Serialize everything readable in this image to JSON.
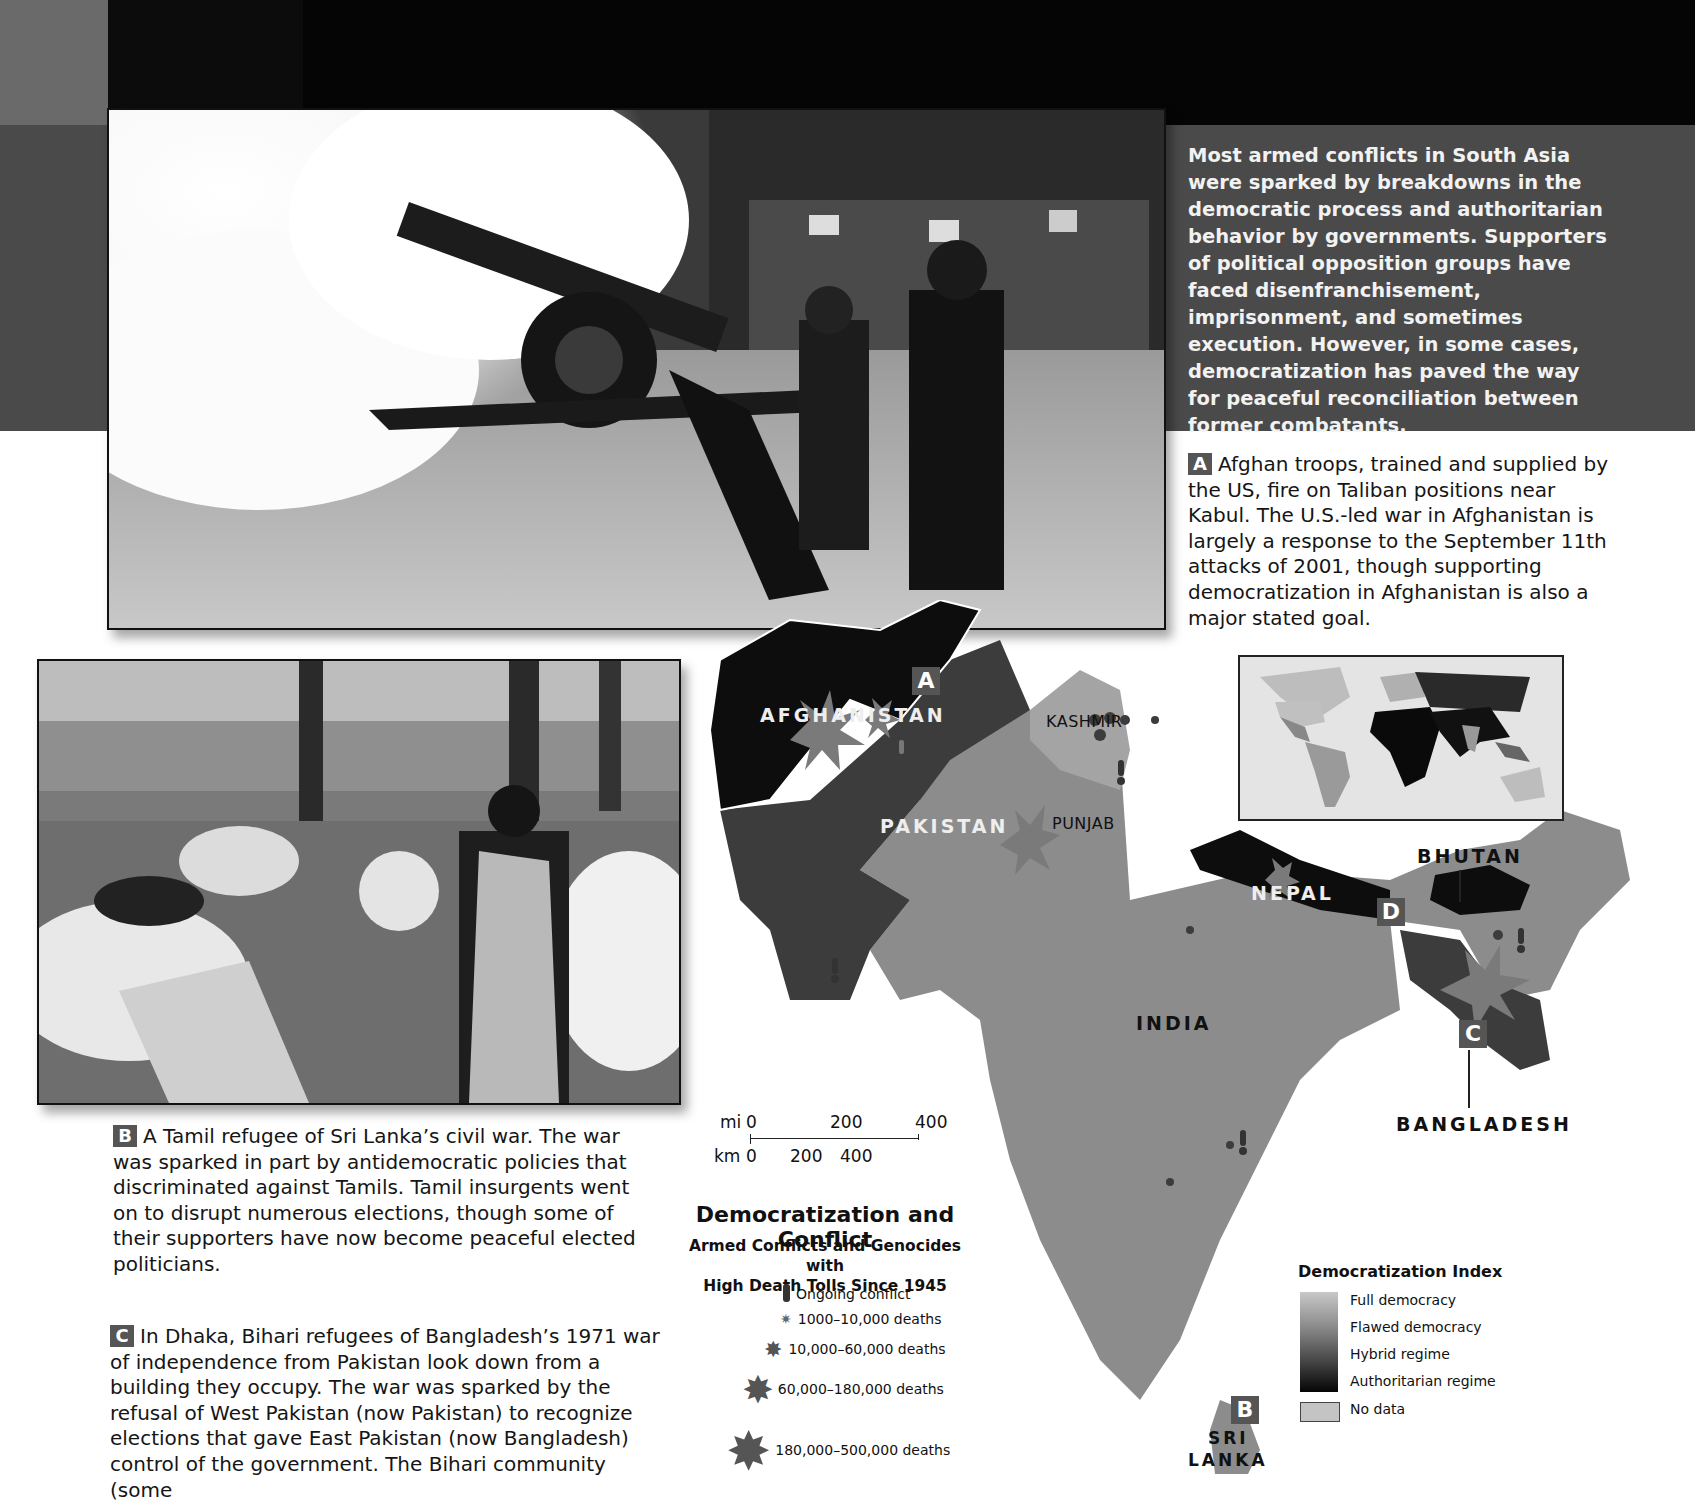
{
  "intro": {
    "text": "Most armed conflicts in South Asia were sparked by breakdowns in the democratic process and authoritarian behavior by governments. Supporters of political opposition groups have faced disenfranchisement, imprisonment, and sometimes execution. However, in some cases, democratization has paved the way for peaceful reconciliation between former combatants."
  },
  "captions": {
    "a": {
      "badge": "A",
      "text": "Afghan troops, trained and supplied by the US, fire on Taliban positions near Kabul. The U.S.-led war in Afghanistan is largely a response to the September 11th attacks of 2001, though supporting democratization in Afghanistan is also a major stated goal."
    },
    "b": {
      "badge": "B",
      "text": "A Tamil refugee of Sri Lanka’s civil war. The war was sparked in part by antidemocratic policies that discriminated against Tamils. Tamil insurgents went on to disrupt numerous elections, though some of their supporters have now become peaceful elected politicians."
    },
    "c": {
      "badge": "C",
      "text": "In Dhaka, Bihari refugees of Bangladesh’s 1971 war of independence from Pakistan look down from a building they occupy. The war was sparked by the refusal of West Pakistan (now Pakistan) to recognize elections that gave East Pakistan (now Bangladesh) control of the government. The Bihari community (some"
    }
  },
  "map": {
    "countries": {
      "afghanistan": "AFGHANISTAN",
      "pakistan": "PAKISTAN",
      "india": "INDIA",
      "nepal": "NEPAL",
      "bhutan": "BHUTAN",
      "bangladesh": "BANGLADESH",
      "sri_lanka_1": "SRI",
      "sri_lanka_2": "LANKA"
    },
    "regions": {
      "kashmir": "KASHMIR",
      "punjab": "PUNJAB"
    },
    "badges": {
      "a": "A",
      "b": "B",
      "c": "C",
      "d": "D"
    },
    "colors": {
      "authoritarian": "#0d0d0d",
      "hybrid": "#3c3c3c",
      "flawed": "#8c8c8c",
      "full": "#c0c0c0",
      "water": "#ffffff",
      "burst": "#7a7a7a"
    }
  },
  "scale_bar": {
    "mi_label": "mi",
    "mi_ticks": [
      "0",
      "200",
      "400"
    ],
    "km_label": "km",
    "km_ticks": [
      "0",
      "200",
      "400"
    ]
  },
  "conflict_legend": {
    "title": "Democratization and Conflict",
    "subtitle_1": "Armed Conflicts and Genocides with",
    "subtitle_2": "High Death Tolls Since 1945",
    "items": [
      {
        "icon": "exclamation-icon",
        "label": "Ongoing conflict"
      },
      {
        "icon": "burst-xs-icon",
        "label": "1000–10,000 deaths"
      },
      {
        "icon": "burst-s-icon",
        "label": "10,000–60,000 deaths"
      },
      {
        "icon": "burst-m-icon",
        "label": "60,000–180,000 deaths"
      },
      {
        "icon": "burst-l-icon",
        "label": "180,000–500,000 deaths"
      }
    ]
  },
  "democratization_legend": {
    "title": "Democratization Index",
    "levels": [
      "Full democracy",
      "Flawed democracy",
      "Hybrid regime",
      "Authoritarian regime"
    ],
    "no_data": "No data"
  }
}
